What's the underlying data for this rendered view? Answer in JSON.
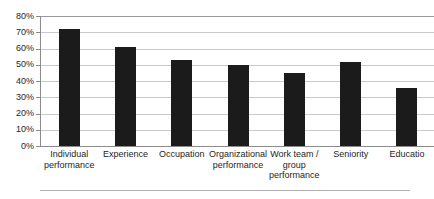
{
  "chart_data": {
    "type": "bar",
    "title": "",
    "subtitle": "",
    "xlabel": "",
    "ylabel": "",
    "ylim": [
      0,
      80
    ],
    "y_tick_labels": [
      "80%",
      "70%",
      "60%",
      "50%",
      "40%",
      "30%",
      "20%",
      "10%",
      "0%"
    ],
    "y_tick_values": [
      80,
      70,
      60,
      50,
      40,
      30,
      20,
      10,
      0
    ],
    "grid": true,
    "legend": false,
    "legend_position": "none",
    "bar_color": "#1b1b1b",
    "categories": [
      "Individual performance",
      "Experience",
      "Occupation",
      "Organizational performance",
      "Work team / group performance",
      "Seniority",
      "Educatio"
    ],
    "category_lines": [
      [
        "Individual",
        "performance"
      ],
      [
        "Experience"
      ],
      [
        "Occupation"
      ],
      [
        "Organizational",
        "performance"
      ],
      [
        "Work team /",
        "group",
        "performance"
      ],
      [
        "Seniority"
      ],
      [
        "Educatio"
      ]
    ],
    "values": [
      72,
      61,
      53,
      50,
      45,
      52,
      36
    ]
  },
  "axis": {
    "y_ticks": [
      {
        "label": "80%",
        "value": 80
      },
      {
        "label": "70%",
        "value": 70
      },
      {
        "label": "60%",
        "value": 60
      },
      {
        "label": "50%",
        "value": 50
      },
      {
        "label": "40%",
        "value": 40
      },
      {
        "label": "30%",
        "value": 30
      },
      {
        "label": "20%",
        "value": 20
      },
      {
        "label": "10%",
        "value": 10
      },
      {
        "label": "0%",
        "value": 0
      }
    ]
  },
  "colors": {
    "bar": "#1b1b1b",
    "gridline": "#c9c9c9",
    "axis": "#8c8c8c",
    "text": "#1e1e1e",
    "background": "#ffffff"
  }
}
